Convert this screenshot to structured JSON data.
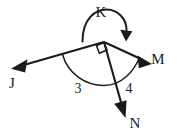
{
  "figure": {
    "type": "geometry-diagram",
    "background_color": "#ffffff",
    "stroke_color": "#1a1a1a",
    "width": 178,
    "height": 135
  },
  "vertex": {
    "name": "vertex-point",
    "x": 104,
    "y": 42
  },
  "rays": [
    {
      "id": "ray-j",
      "label": "J",
      "label_x": 12,
      "label_y": 88,
      "from_x": 104,
      "from_y": 42,
      "to_x": 14,
      "to_y": 68,
      "has_arrowhead": true,
      "direction": "left-down"
    },
    {
      "id": "ray-m",
      "label": "M",
      "label_x": 152,
      "label_y": 64,
      "from_x": 104,
      "from_y": 42,
      "to_x": 150,
      "to_y": 63,
      "has_arrowhead": true,
      "direction": "right-down"
    },
    {
      "id": "ray-n",
      "label": "N",
      "label_x": 130,
      "label_y": 128,
      "from_x": 104,
      "from_y": 42,
      "to_x": 126,
      "to_y": 117,
      "has_arrowhead": true,
      "direction": "down-right"
    }
  ],
  "marks": {
    "right_angle": {
      "name": "right-angle-square",
      "present": true,
      "between": "ray-j and ray-n",
      "value": "90"
    },
    "angle_arc": {
      "name": "reflex-angle-arc",
      "present": true,
      "spans": "from ray-j to ray-m"
    }
  },
  "turn_arc": {
    "label": "K",
    "label_x": 101,
    "label_y": 17,
    "has_arrowhead": true,
    "arrow_end": "right-side-pointing-down",
    "description": "curved arc above vertex"
  },
  "angle_labels": [
    {
      "id": "angle-3",
      "text": "3",
      "x": 78,
      "y": 89,
      "between": "ray-j and ray-n"
    },
    {
      "id": "angle-4",
      "text": "4",
      "x": 128,
      "y": 89,
      "between": "ray-n and ray-m"
    }
  ]
}
